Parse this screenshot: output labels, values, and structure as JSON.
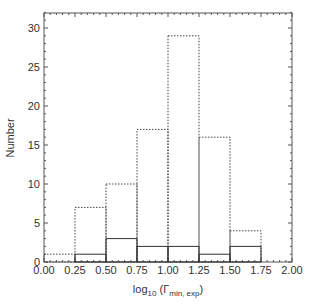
{
  "chart_data": {
    "type": "bar",
    "subtype": "histogram-step",
    "title": "",
    "xlabel": "log10 (Γmin, exp)",
    "xlabel_parts": {
      "main": "log",
      "sub1": "10",
      "paren_open": " (Γ",
      "sub2": "min, exp",
      "paren_close": ")"
    },
    "ylabel": "Number",
    "bin_edges": [
      0.0,
      0.25,
      0.5,
      0.75,
      1.0,
      1.25,
      1.5,
      1.75,
      2.0
    ],
    "categories": [
      "0.00-0.25",
      "0.25-0.50",
      "0.50-0.75",
      "0.75-1.00",
      "1.00-1.25",
      "1.25-1.50",
      "1.50-1.75",
      "1.75-2.00"
    ],
    "series": [
      {
        "name": "dashed",
        "style": "dotted",
        "values": [
          1,
          7,
          10,
          17,
          29,
          16,
          4,
          0
        ]
      },
      {
        "name": "solid",
        "style": "solid",
        "values": [
          0,
          1,
          3,
          2,
          2,
          1,
          2,
          0
        ]
      }
    ],
    "xlim": [
      0.0,
      2.0
    ],
    "ylim": [
      0,
      32
    ],
    "xticks": [
      "0.00",
      "0.25",
      "0.50",
      "0.75",
      "1.00",
      "1.25",
      "1.50",
      "1.75",
      "2.00"
    ],
    "yticks": [
      "0",
      "5",
      "10",
      "15",
      "20",
      "25",
      "30"
    ],
    "grid": false,
    "legend": null
  }
}
